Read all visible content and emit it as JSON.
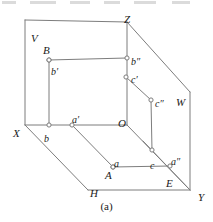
{
  "figure": {
    "caption": "(a)",
    "title_axes": "Three-projection-plane system with point A and its projections",
    "stroke_color": "#7d7d7d",
    "label_color": "#1a1a1a",
    "point_marker": "open-circle",
    "planes": [
      {
        "name": "V",
        "label": "V",
        "x": 31,
        "y": 33
      },
      {
        "name": "H",
        "label": "H",
        "x": 90,
        "y": 188
      },
      {
        "name": "W",
        "label": "W",
        "x": 176,
        "y": 97
      }
    ],
    "axes": [
      {
        "name": "X",
        "label": "X",
        "x": 13,
        "y": 128
      },
      {
        "name": "Y",
        "label": "Y",
        "x": 198,
        "y": 192
      },
      {
        "name": "Z",
        "label": "Z",
        "x": 124,
        "y": 14
      },
      {
        "name": "O",
        "label": "O",
        "x": 118,
        "y": 118
      }
    ],
    "points": [
      {
        "name": "A",
        "label": "A",
        "lx": 105,
        "ly": 170,
        "px": 113,
        "py": 167
      },
      {
        "name": "B",
        "label": "B",
        "lx": 43,
        "ly": 45,
        "px": 49,
        "py": 60
      },
      {
        "name": "E",
        "label": "E",
        "lx": 166,
        "ly": 178,
        "px": null,
        "py": null
      }
    ],
    "projections": [
      {
        "name": "a",
        "label": "a",
        "lx": 114,
        "ly": 159,
        "px": 113,
        "py": 167
      },
      {
        "name": "a-prime",
        "label": "a′",
        "lx": 72,
        "ly": 115,
        "px": 72,
        "py": 125
      },
      {
        "name": "a-double",
        "label": "a″",
        "lx": 171,
        "ly": 157,
        "px": 170,
        "py": 166
      },
      {
        "name": "b",
        "label": "b",
        "lx": 44,
        "ly": 134,
        "px": 49,
        "py": 125
      },
      {
        "name": "b-prime",
        "label": "b′",
        "lx": 51,
        "ly": 67,
        "px": 49,
        "py": 60
      },
      {
        "name": "b-double",
        "label": "b″",
        "lx": 131,
        "ly": 57,
        "px": 127,
        "py": 58
      },
      {
        "name": "c",
        "label": "c",
        "lx": 150,
        "ly": 161,
        "px": 152,
        "py": 150
      },
      {
        "name": "c-prime",
        "label": "c′",
        "lx": 131,
        "ly": 75,
        "px": 126,
        "py": 77
      },
      {
        "name": "c-double",
        "label": "c″",
        "lx": 155,
        "ly": 99,
        "px": 151,
        "py": 100
      }
    ],
    "segments": [
      {
        "name": "v-plane-left-edge",
        "x1": 25,
        "y1": 20,
        "x2": 25,
        "y2": 125
      },
      {
        "name": "v-plane-top-edge",
        "x1": 25,
        "y1": 20,
        "x2": 127,
        "y2": 22
      },
      {
        "name": "z-axis",
        "x1": 127,
        "y1": 22,
        "x2": 127,
        "y2": 125
      },
      {
        "name": "x-axis",
        "x1": 25,
        "y1": 125,
        "x2": 127,
        "y2": 125
      },
      {
        "name": "z-to-w-top",
        "x1": 127,
        "y1": 22,
        "x2": 190,
        "y2": 92
      },
      {
        "name": "w-plane-right-edge",
        "x1": 190,
        "y1": 92,
        "x2": 190,
        "y2": 190
      },
      {
        "name": "y-axis-right",
        "x1": 127,
        "y1": 125,
        "x2": 190,
        "y2": 190
      },
      {
        "name": "x-to-h-corner",
        "x1": 25,
        "y1": 125,
        "x2": 88,
        "y2": 190
      },
      {
        "name": "h-plane-bottom-edge",
        "x1": 88,
        "y1": 190,
        "x2": 190,
        "y2": 190
      },
      {
        "name": "b-prime-to-b-double",
        "x1": 49,
        "y1": 60,
        "x2": 127,
        "y2": 58
      },
      {
        "name": "b-prime-to-b",
        "x1": 49,
        "y1": 60,
        "x2": 49,
        "y2": 125
      },
      {
        "name": "c-prime-to-c-double",
        "x1": 126,
        "y1": 77,
        "x2": 151,
        "y2": 100
      },
      {
        "name": "c-double-to-c",
        "x1": 151,
        "y1": 100,
        "x2": 152,
        "y2": 150
      },
      {
        "name": "a-prime-to-a",
        "x1": 72,
        "y1": 125,
        "x2": 113,
        "y2": 167
      },
      {
        "name": "a-to-a-double",
        "x1": 113,
        "y1": 167,
        "x2": 170,
        "y2": 166
      },
      {
        "name": "c-to-a-double-ray",
        "x1": 143,
        "y1": 141,
        "x2": 190,
        "y2": 190
      }
    ]
  }
}
